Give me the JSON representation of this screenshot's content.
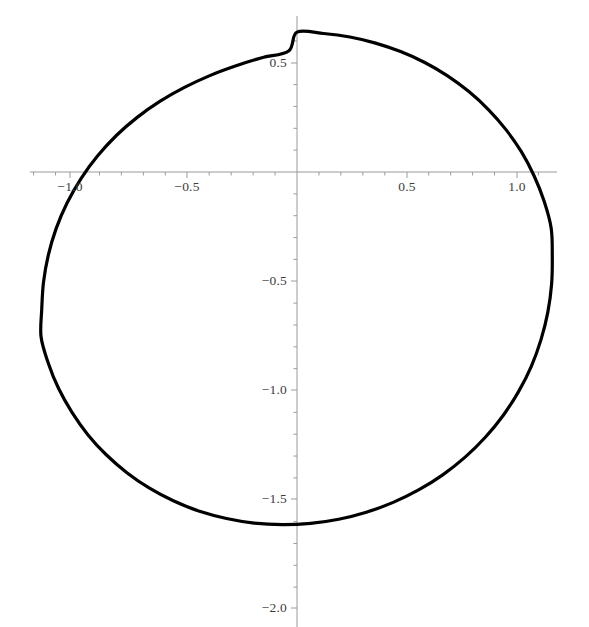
{
  "figure": {
    "type": "plot-figure",
    "width": 589,
    "height": 627,
    "background": "#ffffff",
    "curve_color": "#000000",
    "axis_color": "#9a9a9a",
    "label_color": "#3d3d3d",
    "curve_width": 3.2,
    "axis_width": 1
  },
  "axes": {
    "origin_px": {
      "x": 297,
      "y": 172
    },
    "scale_px_per_unit": {
      "x": 219.5,
      "y": 218.5
    },
    "x_axis_pixel_extent": [
      30,
      557
    ],
    "y_axis_pixel_extent": [
      16,
      627
    ],
    "minor_tick_step": 0.1,
    "major_tick_step": 0.5
  },
  "ticks": {
    "x_major": [
      {
        "value": -1.0,
        "label": "-1.0",
        "px": 70
      },
      {
        "value": -0.5,
        "label": "-0.5",
        "px": 187
      },
      {
        "value": 0.5,
        "label": "0.5",
        "px": 407
      },
      {
        "value": 1.0,
        "label": "1.0",
        "px": 517
      }
    ],
    "y_major": [
      {
        "value": 0.5,
        "label": "0.5",
        "px": 63
      },
      {
        "value": -0.5,
        "label": "-0.5",
        "px": 281
      },
      {
        "value": -1.0,
        "label": "-1.0",
        "px": 390
      },
      {
        "value": -1.5,
        "label": "-1.5",
        "px": 499
      },
      {
        "value": -2.0,
        "label": "-2.0",
        "px": 608
      }
    ],
    "x_minor_values": [
      -1.2,
      -1.1,
      -0.9,
      -0.8,
      -0.7,
      -0.6,
      -0.4,
      -0.3,
      -0.2,
      -0.1,
      0.1,
      0.2,
      0.3,
      0.4,
      0.6,
      0.7,
      0.8,
      0.9,
      1.1,
      1.2
    ],
    "y_minor_values": [
      0.6,
      0.4,
      0.3,
      0.2,
      0.1,
      -0.1,
      -0.2,
      -0.3,
      -0.4,
      -0.6,
      -0.7,
      -0.8,
      -0.9,
      -1.1,
      -1.2,
      -1.3,
      -1.4,
      -1.6,
      -1.7,
      -1.8,
      -1.9,
      -2.1
    ]
  },
  "chart_data": {
    "type": "line",
    "title": "",
    "subtitle": "",
    "xlabel": "",
    "ylabel": "",
    "grid": false,
    "legend": null,
    "legend_position": "none",
    "xlim": [
      -1.217,
      1.184
    ],
    "ylim": [
      -2.084,
      0.718
    ],
    "xticks": [
      -1.0,
      -0.5,
      0.5,
      1.0
    ],
    "xticklabels": [
      "-1.0",
      "-0.5",
      "0.5",
      "1.0"
    ],
    "yticks": [
      0.5,
      -0.5,
      -1.0,
      -1.5,
      -2.0
    ],
    "yticklabels": [
      "0.5",
      "-0.5",
      "-1.0",
      "-1.5",
      "-2.0"
    ],
    "annotations": [],
    "series": [
      {
        "name": "closed-oval-curve",
        "closed": true,
        "color": "#000000",
        "linewidth": 3.2,
        "description": "Closed oval (near-elliptical) curve, widest near y = -0.68, extending from x = -1.16 to x = 1.16 and from y = 0.64 down to y = -2.00",
        "center": [
          0.0,
          -0.68
        ],
        "semi_axis_x": 1.163,
        "semi_axis_y": 1.322,
        "points": [
          [
            0.0,
            0.64
          ],
          [
            0.121,
            0.634
          ],
          [
            0.241,
            0.618
          ],
          [
            0.358,
            0.59
          ],
          [
            0.472,
            0.551
          ],
          [
            0.582,
            0.501
          ],
          [
            0.686,
            0.44
          ],
          [
            0.783,
            0.368
          ],
          [
            0.872,
            0.286
          ],
          [
            0.952,
            0.194
          ],
          [
            1.022,
            0.093
          ],
          [
            1.08,
            -0.017
          ],
          [
            1.126,
            -0.134
          ],
          [
            1.158,
            -0.257
          ],
          [
            1.163,
            -0.384
          ],
          [
            1.16,
            -0.512
          ],
          [
            1.143,
            -0.64
          ],
          [
            1.112,
            -0.766
          ],
          [
            1.068,
            -0.888
          ],
          [
            1.01,
            -1.004
          ],
          [
            0.94,
            -1.113
          ],
          [
            0.858,
            -1.214
          ],
          [
            0.766,
            -1.305
          ],
          [
            0.664,
            -1.386
          ],
          [
            0.554,
            -1.455
          ],
          [
            0.438,
            -1.512
          ],
          [
            0.316,
            -1.557
          ],
          [
            0.19,
            -1.589
          ],
          [
            0.062,
            -1.608
          ],
          [
            -0.067,
            -1.614
          ],
          [
            -0.195,
            -1.607
          ],
          [
            -0.321,
            -1.586
          ],
          [
            -0.444,
            -1.553
          ],
          [
            -0.561,
            -1.506
          ],
          [
            -0.672,
            -1.447
          ],
          [
            -0.775,
            -1.376
          ],
          [
            -0.869,
            -1.294
          ],
          [
            -0.953,
            -1.202
          ],
          [
            -1.025,
            -1.1
          ],
          [
            -1.086,
            -0.991
          ],
          [
            -1.133,
            -0.875
          ],
          [
            -1.166,
            -0.754
          ],
          [
            -1.163,
            -0.63
          ],
          [
            -1.155,
            -0.505
          ],
          [
            -1.133,
            -0.38
          ],
          [
            -1.097,
            -0.258
          ],
          [
            -1.047,
            -0.141
          ],
          [
            -0.984,
            -0.03
          ],
          [
            -0.909,
            0.073
          ],
          [
            -0.823,
            0.167
          ],
          [
            -0.728,
            0.25
          ],
          [
            -0.625,
            0.323
          ],
          [
            -0.515,
            0.386
          ],
          [
            -0.4,
            0.44
          ],
          [
            -0.281,
            0.485
          ],
          [
            -0.16,
            0.523
          ],
          [
            -0.038,
            0.554
          ],
          [
            0.0,
            0.64
          ]
        ]
      }
    ]
  }
}
